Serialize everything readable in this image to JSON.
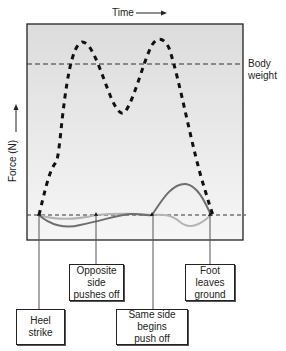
{
  "axis": {
    "x_label": "Time",
    "y_label": "Force (N)"
  },
  "reference_line": {
    "label_line1": "Body",
    "label_line2": "weight"
  },
  "events": [
    {
      "line1": "Heel",
      "line2": "strike"
    },
    {
      "line1": "Opposite side",
      "line2": "pushes off"
    },
    {
      "line1": "Same side begins",
      "line2": "push off"
    },
    {
      "line1": "Foot leaves",
      "line2": "ground"
    }
  ],
  "colors": {
    "plot_bg_top": "#dcdcdc",
    "plot_bg_bottom": "#f4f4f4",
    "vertical_force": "#111111",
    "dark_curve": "#6e6e6e",
    "light_curve": "#b4b4b4"
  }
}
